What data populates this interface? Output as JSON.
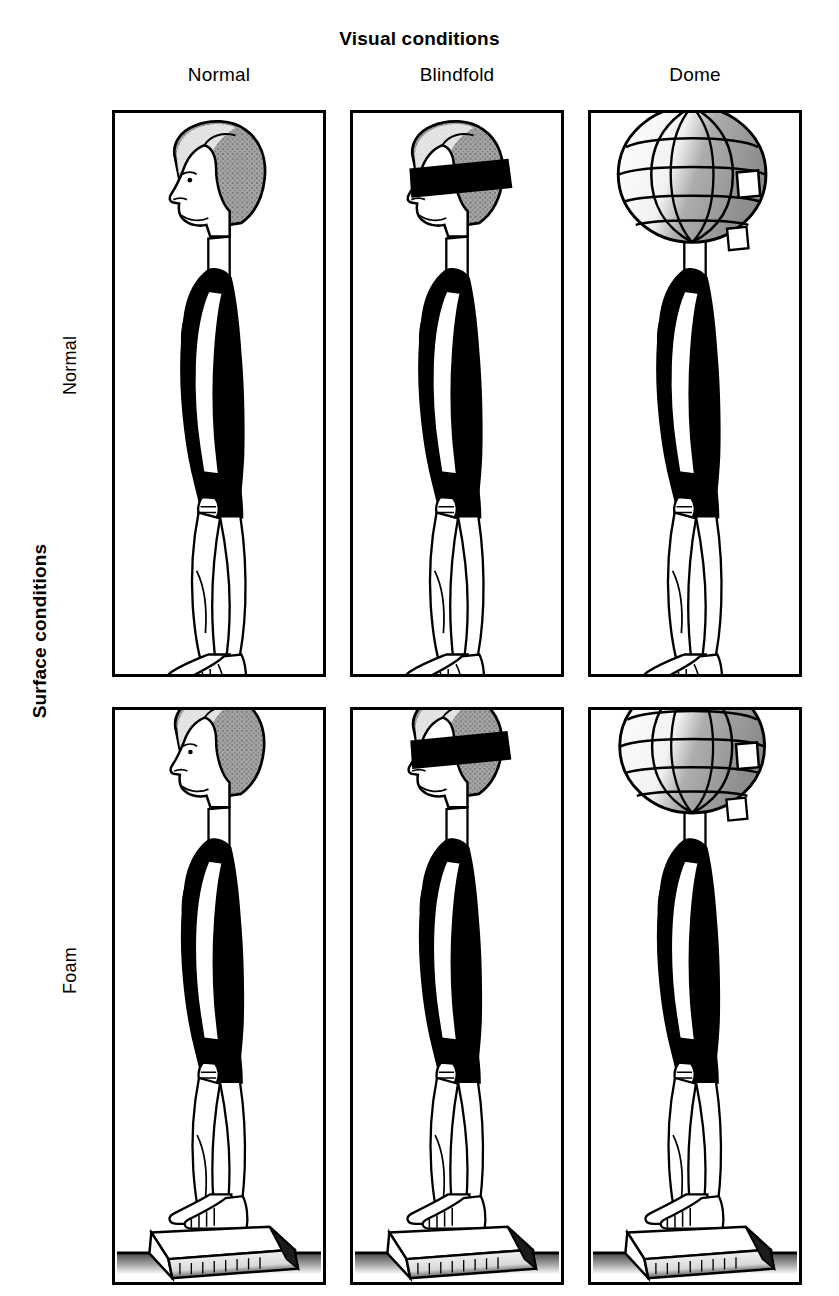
{
  "figure": {
    "column_axis_title": "Visual conditions",
    "row_axis_title": "Surface conditions",
    "column_labels": [
      "Normal",
      "Blindfold",
      "Dome"
    ],
    "row_labels": [
      "Normal",
      "Foam"
    ],
    "panels": [
      {
        "row": "Normal",
        "column": "Normal",
        "vision": "eyes-open",
        "surface": "firm-floor"
      },
      {
        "row": "Normal",
        "column": "Blindfold",
        "vision": "blindfolded",
        "surface": "firm-floor"
      },
      {
        "row": "Normal",
        "column": "Dome",
        "vision": "visual-dome",
        "surface": "firm-floor"
      },
      {
        "row": "Foam",
        "column": "Normal",
        "vision": "eyes-open",
        "surface": "foam-pad"
      },
      {
        "row": "Foam",
        "column": "Blindfold",
        "vision": "blindfolded",
        "surface": "foam-pad"
      },
      {
        "row": "Foam",
        "column": "Dome",
        "vision": "visual-dome",
        "surface": "foam-pad"
      }
    ],
    "colors": {
      "ink": "#000000",
      "background": "#ffffff",
      "hair_shading": "#9b9b9b",
      "dome_shading": "#9a9a9a",
      "floor_texture": "#6f6f6f"
    }
  }
}
